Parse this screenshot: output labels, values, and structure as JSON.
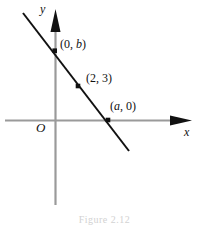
{
  "figure": {
    "caption": "Figure 2.12",
    "axis_x_label": "x",
    "axis_y_label": "y",
    "origin_label": "O",
    "line_color": "#111111",
    "axis_color": "#9a9a9a",
    "arrow_color": "#111111",
    "background_color": "#ffffff"
  },
  "labels": {
    "y_intercept": "(0, b)",
    "mid_point": "(2, 3)",
    "x_intercept": "(a, 0)"
  },
  "chart_data": {
    "type": "line",
    "title": "",
    "xlabel": "x",
    "ylabel": "y",
    "grid": false,
    "legend": "none",
    "axes": {
      "origin_label": "O",
      "x_axis": {
        "pixel_y": 120,
        "pixel_x_start": 5,
        "pixel_x_end": 192,
        "arrow": "right"
      },
      "y_axis": {
        "pixel_x": 55,
        "pixel_y_start": 10,
        "pixel_y_end": 205,
        "arrow": "up"
      }
    },
    "series": [
      {
        "name": "line",
        "style": "solid",
        "color": "#111111",
        "endpoints_pixels": [
          [
            23,
            13
          ],
          [
            129,
            151
          ]
        ],
        "points": [
          {
            "label": "(0, b)",
            "kind": "y-intercept",
            "x": 0,
            "y": "b",
            "pixel": [
              55,
              51
            ]
          },
          {
            "label": "(2, 3)",
            "kind": "point-on-line",
            "x": 2,
            "y": 3,
            "pixel": [
              78,
              86
            ]
          },
          {
            "label": "(a, 0)",
            "kind": "x-intercept",
            "x": "a",
            "y": 0,
            "pixel": [
              108,
              120
            ]
          }
        ]
      }
    ],
    "annotations": [
      {
        "text": "(0, b)",
        "pixel": [
          60,
          39
        ]
      },
      {
        "text": "(2, 3)",
        "pixel": [
          86,
          73
        ]
      },
      {
        "text": "(a, 0)",
        "pixel": [
          110,
          101
        ]
      },
      {
        "text": "O",
        "pixel": [
          37,
          122
        ]
      },
      {
        "text": "y",
        "pixel": [
          41,
          4
        ]
      },
      {
        "text": "x",
        "pixel": [
          185,
          127
        ]
      }
    ]
  }
}
